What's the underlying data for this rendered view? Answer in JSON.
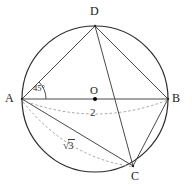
{
  "figure": {
    "kind": "geometry-diagram",
    "canvas": {
      "width": 192,
      "height": 188,
      "background": "#ffffff"
    },
    "colors": {
      "circle_stroke": "#2b2b2b",
      "solid_chord": "#4a4a4a",
      "dashed_arc": "#9a9a9a",
      "label_text": "#1a1a1a",
      "measure_text": "#3a3a3a",
      "center_dot": "#000000"
    },
    "circle": {
      "name": "circumscribed-circle",
      "cx": 95,
      "cy": 99,
      "r": 73,
      "stroke_width": 1.2
    },
    "center": {
      "name": "center-point-O",
      "label": "O",
      "x": 95,
      "y": 99,
      "label_x": 90,
      "label_y": 85,
      "dot_r": 2.0
    },
    "points": [
      {
        "id": "A",
        "label": "A",
        "x": 22,
        "y": 99,
        "label_x": 5,
        "label_y": 92
      },
      {
        "id": "B",
        "label": "B",
        "x": 168,
        "y": 99,
        "label_x": 172,
        "label_y": 92
      },
      {
        "id": "C",
        "label": "C",
        "x": 133,
        "y": 166,
        "label_x": 131,
        "label_y": 170
      },
      {
        "id": "D",
        "label": "D",
        "x": 95,
        "y": 26,
        "label_x": 90,
        "label_y": 5
      }
    ],
    "solid_segments": [
      {
        "name": "segment-AB",
        "from": "A",
        "to": "B",
        "x1": 22,
        "y1": 99,
        "x2": 168,
        "y2": 99
      },
      {
        "name": "segment-AD",
        "from": "A",
        "to": "D",
        "x1": 22,
        "y1": 99,
        "x2": 95,
        "y2": 26
      },
      {
        "name": "segment-DB",
        "from": "D",
        "to": "B",
        "x1": 95,
        "y1": 26,
        "x2": 168,
        "y2": 99
      },
      {
        "name": "segment-DC",
        "from": "D",
        "to": "C",
        "x1": 95,
        "y1": 26,
        "x2": 133,
        "y2": 166
      },
      {
        "name": "segment-BC",
        "from": "B",
        "to": "C",
        "x1": 168,
        "y1": 99,
        "x2": 133,
        "y2": 166
      },
      {
        "name": "segment-AC",
        "from": "A",
        "to": "C",
        "x1": 22,
        "y1": 99,
        "x2": 133,
        "y2": 166
      }
    ],
    "dashed_arcs": [
      {
        "name": "measure-arc-AB",
        "from": "A",
        "to": "B",
        "path": "M 22 100 Q 95 128 168 100",
        "measure_label": "2"
      },
      {
        "name": "measure-arc-AC",
        "from": "A",
        "to": "C",
        "path": "M 23 102 Q 68 158 134 167",
        "measure_label": "sqrt3"
      }
    ],
    "angle_marker": {
      "name": "angle-DAB",
      "vertex": "A",
      "label": "45°",
      "label_x": 33,
      "label_y": 84,
      "arc_path": "M 46 99 A 24 24 0 0 0 39 82"
    },
    "measure_labels": [
      {
        "name": "label-length-2",
        "text": "2",
        "x": 90,
        "y": 107
      },
      {
        "name": "label-length-sqrt3",
        "text": "3",
        "prefix": "√",
        "x": 63,
        "y": 139
      }
    ]
  }
}
